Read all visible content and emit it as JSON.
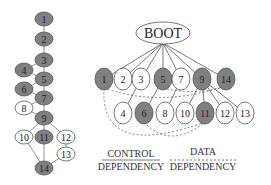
{
  "colors": {
    "filled": "#808080",
    "empty": "#ffffff",
    "stroke": "#555555",
    "text": "#222222"
  },
  "left_graph": {
    "nodes": [
      {
        "id": "1",
        "x": 44,
        "y": 19,
        "filled": true
      },
      {
        "id": "2",
        "x": 44,
        "y": 39,
        "filled": true
      },
      {
        "id": "3",
        "x": 44,
        "y": 60,
        "filled": true
      },
      {
        "id": "4",
        "x": 24,
        "y": 70,
        "filled": true
      },
      {
        "id": "5",
        "x": 44,
        "y": 79,
        "filled": true
      },
      {
        "id": "6",
        "x": 24,
        "y": 89,
        "filled": true
      },
      {
        "id": "7",
        "x": 44,
        "y": 98,
        "filled": true
      },
      {
        "id": "8",
        "x": 24,
        "y": 108,
        "filled": false
      },
      {
        "id": "9",
        "x": 44,
        "y": 118,
        "filled": true
      },
      {
        "id": "10",
        "x": 24,
        "y": 137,
        "filled": false
      },
      {
        "id": "11",
        "x": 44,
        "y": 137,
        "filled": true
      },
      {
        "id": "12",
        "x": 66,
        "y": 137,
        "filled": false
      },
      {
        "id": "13",
        "x": 66,
        "y": 154,
        "filled": false
      },
      {
        "id": "14",
        "x": 44,
        "y": 168,
        "filled": true
      }
    ],
    "edges": [
      [
        "1",
        "2"
      ],
      [
        "2",
        "3"
      ],
      [
        "3",
        "4"
      ],
      [
        "3",
        "5"
      ],
      [
        "4",
        "5"
      ],
      [
        "5",
        "6"
      ],
      [
        "5",
        "7"
      ],
      [
        "6",
        "7"
      ],
      [
        "7",
        "8"
      ],
      [
        "7",
        "9"
      ],
      [
        "8",
        "9"
      ],
      [
        "9",
        "10"
      ],
      [
        "9",
        "11"
      ],
      [
        "9",
        "12"
      ],
      [
        "10",
        "14"
      ],
      [
        "11",
        "14"
      ],
      [
        "12",
        "13"
      ],
      [
        "13",
        "14"
      ]
    ]
  },
  "right_graph": {
    "root": {
      "label": "BOOT",
      "x": 163,
      "y": 33
    },
    "top_row": [
      {
        "id": "1",
        "x": 104,
        "y": 79,
        "filled": true
      },
      {
        "id": "2",
        "x": 123,
        "y": 79,
        "filled": false
      },
      {
        "id": "3",
        "x": 141,
        "y": 79,
        "filled": false
      },
      {
        "id": "5",
        "x": 163,
        "y": 79,
        "filled": true
      },
      {
        "id": "7",
        "x": 181,
        "y": 79,
        "filled": false
      },
      {
        "id": "9",
        "x": 202,
        "y": 79,
        "filled": true
      },
      {
        "id": "14",
        "x": 226,
        "y": 79,
        "filled": true
      }
    ],
    "bottom_row": [
      {
        "id": "4",
        "x": 123,
        "y": 113,
        "filled": false
      },
      {
        "id": "6",
        "x": 144,
        "y": 113,
        "filled": true
      },
      {
        "id": "8",
        "x": 165,
        "y": 113,
        "filled": false
      },
      {
        "id": "10",
        "x": 185,
        "y": 113,
        "filled": false
      },
      {
        "id": "11",
        "x": 205,
        "y": 113,
        "filled": true
      },
      {
        "id": "12",
        "x": 225,
        "y": 113,
        "filled": false
      },
      {
        "id": "13",
        "x": 245,
        "y": 113,
        "filled": false
      }
    ],
    "control_edges": [
      [
        "BOOT",
        "1"
      ],
      [
        "BOOT",
        "2"
      ],
      [
        "BOOT",
        "3"
      ],
      [
        "BOOT",
        "5"
      ],
      [
        "BOOT",
        "7"
      ],
      [
        "BOOT",
        "9"
      ],
      [
        "BOOT",
        "14"
      ],
      [
        "3",
        "4"
      ],
      [
        "5",
        "6"
      ],
      [
        "7",
        "8"
      ],
      [
        "9",
        "10"
      ],
      [
        "9",
        "11"
      ],
      [
        "9",
        "12"
      ],
      [
        "9",
        "13"
      ]
    ],
    "data_edges": [
      [
        "1",
        "14"
      ],
      [
        "1",
        "11"
      ],
      [
        "6",
        "11"
      ],
      [
        "5",
        "14"
      ]
    ]
  },
  "legend": {
    "control": {
      "line1": "CONTROL",
      "line2": "DEPENDENCY",
      "style": "solid"
    },
    "data": {
      "line1": "DATA",
      "line2": "DEPENDENCY",
      "style": "dashed"
    }
  }
}
